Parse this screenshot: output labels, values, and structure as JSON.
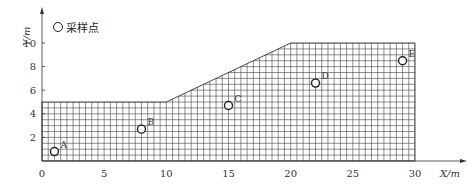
{
  "legend": {
    "label": "采样点"
  },
  "axes": {
    "xlabel": "X/m",
    "ylabel": "Y/m",
    "xticks": [
      "0",
      "5",
      "10",
      "15",
      "20",
      "25",
      "30"
    ],
    "yticks": [
      "2",
      "4",
      "6",
      "8",
      "10"
    ]
  },
  "chart_data": {
    "type": "scatter",
    "title": "",
    "xlabel": "X/m",
    "ylabel": "Y/m",
    "xlim": [
      0,
      30
    ],
    "ylim": [
      0,
      10
    ],
    "grid": true,
    "legend_position": "top-left",
    "legend": [
      "采样点"
    ],
    "domain_outline": [
      [
        0,
        0
      ],
      [
        0,
        5
      ],
      [
        10,
        5
      ],
      [
        20,
        10
      ],
      [
        30,
        10
      ],
      [
        30,
        0
      ]
    ],
    "points": [
      {
        "label": "A",
        "x": 1,
        "y": 0.8
      },
      {
        "label": "B",
        "x": 8,
        "y": 2.7
      },
      {
        "label": "C",
        "x": 15,
        "y": 4.7
      },
      {
        "label": "D",
        "x": 22,
        "y": 6.6
      },
      {
        "label": "E",
        "x": 29,
        "y": 8.5
      }
    ]
  }
}
